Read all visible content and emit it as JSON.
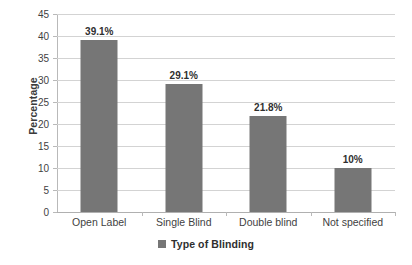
{
  "chart_data": {
    "type": "bar",
    "title": "",
    "subtitle": "",
    "xlabel": "",
    "ylabel": "Percentage",
    "categories": [
      "Open Label",
      "Single Blind",
      "Double blind",
      "Not specified"
    ],
    "values": [
      39.1,
      29.1,
      21.8,
      10
    ],
    "data_labels": [
      "39.1%",
      "29.1%",
      "21.8%",
      "10%"
    ],
    "series": [
      {
        "name": "Type of Blinding",
        "values": [
          39.1,
          29.1,
          21.8,
          10
        ]
      }
    ],
    "ylim": [
      0,
      45
    ],
    "ytick_values": [
      0,
      5,
      10,
      15,
      20,
      25,
      30,
      35,
      40,
      45
    ],
    "ytick_labels": [
      "0",
      "5",
      "10",
      "15",
      "20",
      "25",
      "30",
      "35",
      "40",
      "45"
    ],
    "grid": true,
    "grid_axis": "y",
    "legend": {
      "position": "bottom",
      "entries": [
        {
          "label": "Type of Blinding",
          "color": "#767676"
        }
      ]
    },
    "colors": {
      "bar": "#767676",
      "gridline": "#d3d3d3",
      "axis": "#b9b9b9",
      "text": "#3f3f3f",
      "background": "#ffffff"
    }
  }
}
